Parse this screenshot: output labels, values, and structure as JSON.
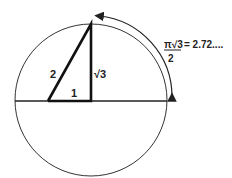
{
  "diagram": {
    "triangle": {
      "hypotenuse_label": "2",
      "vertical_leg_label": "√3",
      "base_label": "1"
    },
    "arc_annotation": {
      "numerator": "π√3",
      "equals": "= 2.72....",
      "denominator": "2"
    },
    "colors": {
      "stroke": "#222222",
      "background": "#ffffff"
    }
  }
}
